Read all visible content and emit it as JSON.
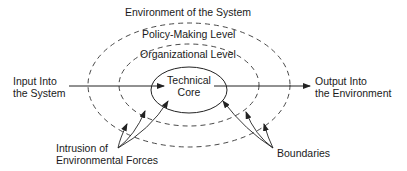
{
  "diagram": {
    "title": "Environment of the System",
    "levels": {
      "outer": "Policy-Making Level",
      "middle": "Organizational Level",
      "core_line1": "Technical",
      "core_line2": "Core"
    },
    "input": {
      "line1": "Input Into",
      "line2": "the System"
    },
    "output": {
      "line1": "Output Into",
      "line2": "the Environment"
    },
    "intrusion": {
      "line1": "Intrusion of",
      "line2": "Environmental Forces"
    },
    "boundaries": "Boundaries"
  },
  "colors": {
    "stroke": "#222222",
    "text": "#1a1a1a",
    "background": "#ffffff"
  }
}
